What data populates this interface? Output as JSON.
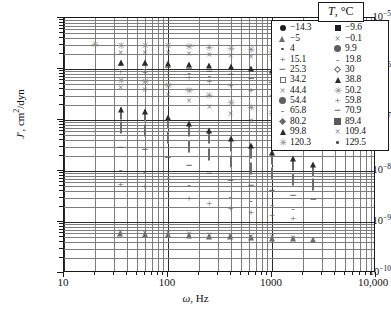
{
  "chart_data": {
    "type": "scatter",
    "title": "",
    "xlabel": "ω, Hz",
    "ylabel": "J', cm2/dyn",
    "xscale": "log",
    "yscale": "log",
    "xlim": [
      10,
      10000
    ],
    "ylim": [
      1e-10,
      1e-05
    ],
    "grid": true,
    "legend_position": "top-right",
    "legend_title": "T, °C",
    "x_ticks": [
      "10",
      "100",
      "1000",
      "10,000"
    ],
    "y_ticks": [
      "10-5",
      "10-6",
      "10-7",
      "10-8",
      "10-9",
      "10-10"
    ],
    "series": [
      {
        "name": "-14.3",
        "marker": "filled-circle",
        "x": [
          35,
          60,
          100,
          160,
          250,
          400,
          630,
          1000,
          1600,
          2500,
          4000
        ],
        "y": [
          1.2e-09,
          1.2e-09,
          4.3e-10,
          4e-10,
          3.9e-10,
          3.8e-10,
          3.7e-10,
          3.6e-10,
          3.5e-10,
          3.4e-10,
          2.9e-10
        ]
      },
      {
        "name": "-9.6",
        "marker": "filled-square",
        "x": [
          100,
          160,
          250,
          400,
          630,
          1000,
          1600,
          2500
        ],
        "y": [
          4.3e-10,
          4.2e-10,
          4.1e-10,
          4e-10,
          3.9e-10,
          3.8e-10,
          3.7e-10,
          3.6e-10
        ]
      },
      {
        "name": "-5",
        "marker": "open-triangle",
        "x": [
          35,
          60,
          100,
          160,
          250,
          400,
          630,
          1000,
          1600,
          2500
        ],
        "y": [
          5.3e-10,
          5.2e-10,
          5e-10,
          4.9e-10,
          4.7e-10,
          4.6e-10,
          4.4e-10,
          4.3e-10,
          4.2e-10,
          4e-10
        ]
      },
      {
        "name": "-0.1",
        "marker": "cross-x",
        "x": [
          35,
          60,
          100,
          160,
          250,
          400,
          630,
          1000,
          1600
        ],
        "y": [
          6.4e-10,
          6.2e-10,
          6e-10,
          5.8e-10,
          5.6e-10,
          5.4e-10,
          5.2e-10,
          5e-10,
          4.8e-10
        ]
      },
      {
        "name": "4",
        "marker": "small-dot",
        "x": [
          35,
          60,
          100,
          160,
          250,
          400,
          630,
          1000
        ],
        "y": [
          2e-09,
          1.9e-09,
          1.2e-09,
          9e-10,
          8e-10,
          7.2e-10,
          6.6e-10,
          6e-10
        ]
      },
      {
        "name": "9.9",
        "marker": "filled-circle-gray",
        "x": [
          35,
          60,
          100,
          160,
          250,
          400,
          630,
          1000
        ],
        "y": [
          3.2e-09,
          3e-09,
          2.2e-09,
          1.6e-09,
          1.3e-09,
          1.1e-09,
          9.5e-10,
          8.6e-10
        ]
      },
      {
        "name": "15.1",
        "marker": "plus",
        "x": [
          35,
          60,
          100,
          160,
          250,
          400,
          630,
          1000,
          1600
        ],
        "y": [
          5.6e-09,
          5.2e-09,
          4e-09,
          3e-09,
          2.4e-09,
          1.9e-09,
          1.6e-09,
          1.4e-09,
          1.2e-09
        ]
      },
      {
        "name": "19.8",
        "marker": "dash",
        "x": [
          35,
          60,
          100,
          160,
          250,
          400,
          630,
          1000,
          1600
        ],
        "y": [
          1.1e-08,
          1e-08,
          7.6e-09,
          5.6e-09,
          4.2e-09,
          3.3e-09,
          2.7e-09,
          2.3e-09,
          1.9e-09
        ]
      },
      {
        "name": "25.3",
        "marker": "minus",
        "x": [
          35,
          60,
          100,
          160,
          250,
          400,
          630,
          1000,
          1600,
          2500
        ],
        "y": [
          3e-08,
          2.7e-08,
          1.9e-08,
          1.3e-08,
          9.2e-09,
          6.8e-09,
          5.3e-09,
          4.2e-09,
          3.4e-09,
          2.8e-09
        ]
      },
      {
        "name": "30",
        "marker": "open-diamond",
        "x": [
          35,
          60,
          100,
          160,
          250,
          400,
          630,
          1000,
          1600,
          2500
        ],
        "y": [
          7e-08,
          6.2e-08,
          4.4e-08,
          3e-08,
          2.1e-08,
          1.5e-08,
          1.1e-08,
          8.6e-09,
          6.8e-09,
          5.4e-09
        ]
      },
      {
        "name": "34.2",
        "marker": "open-square",
        "x": [
          35,
          60,
          100,
          160,
          250,
          400,
          630,
          1000,
          1600,
          2500
        ],
        "y": [
          1.3e-07,
          1.2e-07,
          8.8e-08,
          6.2e-08,
          4.4e-08,
          3.1e-08,
          2.3e-08,
          1.7e-08,
          1.3e-08,
          1e-08
        ]
      },
      {
        "name": "38.8",
        "marker": "filled-triangle",
        "x": [
          35,
          60,
          100,
          160,
          250,
          400,
          630,
          1000,
          1600,
          2500
        ],
        "y": [
          2.3e-07,
          2.1e-07,
          1.6e-07,
          1.2e-07,
          8.6e-08,
          6.2e-08,
          4.5e-08,
          3.3e-08,
          2.5e-08,
          1.9e-08
        ]
      },
      {
        "name": "44.4",
        "marker": "cross-x",
        "x": [
          35,
          60,
          100,
          160,
          250,
          400,
          630,
          1000,
          1600,
          2500
        ],
        "y": [
          4.2e-07,
          3.9e-07,
          3.1e-07,
          2.4e-07,
          1.8e-07,
          1.3e-07,
          9.6e-08,
          7.2e-08,
          5.4e-08,
          4e-08
        ]
      },
      {
        "name": "50.2",
        "marker": "star",
        "x": [
          35,
          60,
          100,
          160,
          250,
          400,
          630,
          1000,
          1600,
          2500
        ],
        "y": [
          5.8e-07,
          5.5e-07,
          4.6e-07,
          3.7e-07,
          2.9e-07,
          2.2e-07,
          1.7e-07,
          1.3e-07,
          9.8e-08,
          7.4e-08
        ]
      },
      {
        "name": "54.4",
        "marker": "filled-circle-gray",
        "x": [
          35,
          60,
          100,
          160,
          250,
          400,
          630,
          1000,
          1600,
          2500
        ],
        "y": [
          7.4e-07,
          7.1e-07,
          6.2e-07,
          5.2e-07,
          4.2e-07,
          3.4e-07,
          2.7e-07,
          2.1e-07,
          1.6e-07,
          1.25e-07
        ]
      },
      {
        "name": "59.8",
        "marker": "plus",
        "x": [
          35,
          60,
          100,
          160,
          250,
          400,
          630,
          1000,
          1600,
          2500
        ],
        "y": [
          9.2e-07,
          8.9e-07,
          8e-07,
          6.9e-07,
          5.8e-07,
          4.8e-07,
          3.9e-07,
          3.1e-07,
          2.4e-07,
          1.9e-07
        ]
      },
      {
        "name": "65.8",
        "marker": "dash",
        "x": [
          35,
          60,
          100,
          160,
          250,
          400,
          630,
          1000,
          1600,
          2500
        ],
        "y": [
          1.05e-06,
          1.03e-06,
          9.6e-07,
          8.6e-07,
          7.5e-07,
          6.4e-07,
          5.3e-07,
          4.3e-07,
          3.5e-07,
          2.8e-07
        ]
      },
      {
        "name": "70.9",
        "marker": "minus",
        "x": [
          35,
          60,
          100,
          160,
          250,
          400,
          630,
          1000,
          1600,
          2500
        ],
        "y": [
          1.2e-06,
          1.18e-06,
          1.12e-06,
          1.03e-06,
          9.2e-07,
          8e-07,
          6.8e-07,
          5.7e-07,
          4.6e-07,
          3.8e-07
        ]
      },
      {
        "name": "80.2",
        "marker": "gray-diamond",
        "x": [
          35,
          60,
          100,
          160,
          250,
          400,
          630,
          1000,
          1600,
          2500
        ],
        "y": [
          1.35e-06,
          1.33e-06,
          1.28e-06,
          1.21e-06,
          1.12e-06,
          1e-06,
          8.9e-07,
          7.7e-07,
          6.5e-07,
          5.4e-07
        ]
      },
      {
        "name": "89.4",
        "marker": "gray-square",
        "x": [
          35,
          60,
          100,
          160,
          250,
          400,
          630,
          1000,
          1600,
          2500
        ],
        "y": [
          1.55e-06,
          1.53e-06,
          1.48e-06,
          1.42e-06,
          1.34e-06,
          1.24e-06,
          1.13e-06,
          1e-06,
          8.8e-07,
          7.4e-07
        ]
      },
      {
        "name": "99.8",
        "marker": "filled-triangle",
        "x": [
          35,
          60,
          100,
          160,
          250,
          400,
          630,
          1000,
          1600,
          2500
        ],
        "y": [
          1.9e-06,
          1.88e-06,
          1.82e-06,
          1.76e-06,
          1.68e-06,
          1.58e-06,
          1.46e-06,
          1.33e-06,
          1.2e-06,
          1.05e-06
        ]
      },
      {
        "name": "109.4",
        "marker": "cross-x",
        "x": [
          35,
          60,
          100,
          160,
          250,
          400,
          630,
          1000,
          1600,
          2500
        ],
        "y": [
          2.1e-06,
          2.08e-06,
          2.02e-06,
          1.96e-06,
          1.88e-06,
          1.8e-06,
          1.7e-06,
          1.58e-06,
          1.45e-06,
          1.32e-06
        ]
      },
      {
        "name": "120.3",
        "marker": "star",
        "x": [
          20,
          35,
          60,
          100,
          160,
          250,
          400,
          630,
          1000,
          1600,
          2500
        ],
        "y": [
          2.9e-06,
          2.85e-06,
          2.82e-06,
          2.78e-06,
          2.7e-06,
          2.6e-06,
          2.5e-06,
          2.35e-06,
          2.2e-06,
          2.05e-06,
          1.9e-06
        ]
      },
      {
        "name": "129.5",
        "marker": "small-dot",
        "x": [
          35,
          60,
          100,
          160,
          250,
          400,
          630,
          1000,
          1600,
          2500
        ],
        "y": [
          3.1e-06,
          3.05e-06,
          3e-06,
          2.95e-06,
          2.88e-06,
          2.8e-06,
          2.7e-06,
          2.58e-06,
          2.45e-06,
          2.3e-06
        ]
      }
    ]
  },
  "axes": {
    "y_label_main": "J",
    "y_label_rest": ", cm",
    "y_label_sup": "2",
    "y_label_tail": "/dyn",
    "x_label_sym": "ω",
    "x_label_rest": ", Hz",
    "y_ticks": [
      {
        "mant": "10",
        "exp": "−5"
      },
      {
        "mant": "10",
        "exp": "−6"
      },
      {
        "mant": "10",
        "exp": "−7"
      },
      {
        "mant": "10",
        "exp": "−8"
      },
      {
        "mant": "10",
        "exp": "−9"
      },
      {
        "mant": "10",
        "exp": "−10"
      }
    ],
    "x_ticks": [
      {
        "label": "10"
      },
      {
        "label": "100"
      },
      {
        "label": "1000"
      },
      {
        "label": "10,000"
      }
    ]
  },
  "legend": {
    "title_sym": "T",
    "title_rest": ", °C",
    "rows": [
      {
        "left_sym": "filled-circle",
        "left": "−14.3",
        "right_sym": "filled-square",
        "right": "−9.6"
      },
      {
        "left_sym": "open-triangle",
        "left": "−5",
        "right_sym": "cross-x",
        "right": "−0.1"
      },
      {
        "left_sym": "small-dot",
        "left": "4",
        "right_sym": "filled-circle-gray",
        "right": "9.9"
      },
      {
        "left_sym": "plus",
        "left": "15.1",
        "right_sym": "dash",
        "right": "19.8"
      },
      {
        "left_sym": "minus",
        "left": "25.3",
        "right_sym": "open-diamond",
        "right": "30"
      },
      {
        "left_sym": "open-square",
        "left": "34.2",
        "right_sym": "filled-triangle",
        "right": "38.8"
      },
      {
        "left_sym": "cross-x",
        "left": "44.4",
        "right_sym": "star",
        "right": "50.2"
      },
      {
        "left_sym": "filled-circle-gray",
        "left": "54.4",
        "right_sym": "plus",
        "right": "59.8"
      },
      {
        "left_sym": "dash",
        "left": "65.8",
        "right_sym": "minus",
        "right": "70.9"
      },
      {
        "left_sym": "gray-diamond",
        "left": "80.2",
        "right_sym": "gray-square",
        "right": "89.4"
      },
      {
        "left_sym": "filled-triangle",
        "left": "99.8",
        "right_sym": "cross-x",
        "right": "109.4"
      },
      {
        "left_sym": "star",
        "left": "120.3",
        "right_sym": "small-dot",
        "right": "129.5"
      }
    ]
  }
}
